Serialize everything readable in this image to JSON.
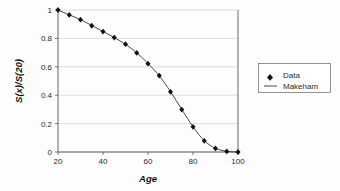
{
  "chart_data": {
    "type": "line",
    "title": "",
    "xlabel": "Age",
    "ylabel": "S(x)/S(20)",
    "xlim": [
      20,
      100
    ],
    "ylim": [
      0,
      1
    ],
    "grid": true,
    "legend_position": "right",
    "xticks": [
      20,
      40,
      60,
      80,
      100
    ],
    "xtick_labels": [
      "20",
      "40",
      "60",
      "80",
      "100"
    ],
    "yticks": [
      0,
      0.2,
      0.4,
      0.6,
      0.8,
      1
    ],
    "ytick_labels": [
      "0",
      "0.2",
      "0.4",
      "0.6",
      "0.8",
      "1"
    ],
    "x": [
      20,
      25,
      30,
      35,
      40,
      45,
      50,
      55,
      60,
      65,
      70,
      75,
      80,
      85,
      90,
      95,
      100
    ],
    "series": [
      {
        "name": "Data",
        "marker": "diamond",
        "values": [
          1.0,
          0.965,
          0.932,
          0.889,
          0.848,
          0.806,
          0.759,
          0.698,
          0.622,
          0.538,
          0.424,
          0.299,
          0.177,
          0.079,
          0.025,
          0.004,
          0.0
        ]
      },
      {
        "name": "Makeham",
        "marker": "line",
        "values": [
          1.0,
          0.966,
          0.932,
          0.891,
          0.849,
          0.806,
          0.758,
          0.699,
          0.623,
          0.537,
          0.425,
          0.3,
          0.178,
          0.08,
          0.026,
          0.005,
          0.0
        ]
      }
    ],
    "legend": [
      {
        "label": "Data",
        "marker": "diamond"
      },
      {
        "label": "Makeham",
        "marker": "line"
      }
    ]
  },
  "axis": {
    "x_title": "Age",
    "y_title": "S(x)/S(20)"
  },
  "legend": {
    "data_label": "Data",
    "makeham_label": "Makeham"
  },
  "colors": {
    "marker": "#111111",
    "line": "#333333",
    "grid": "#c8c8c8",
    "axis": "#555555",
    "background": "#fdfdfd"
  }
}
